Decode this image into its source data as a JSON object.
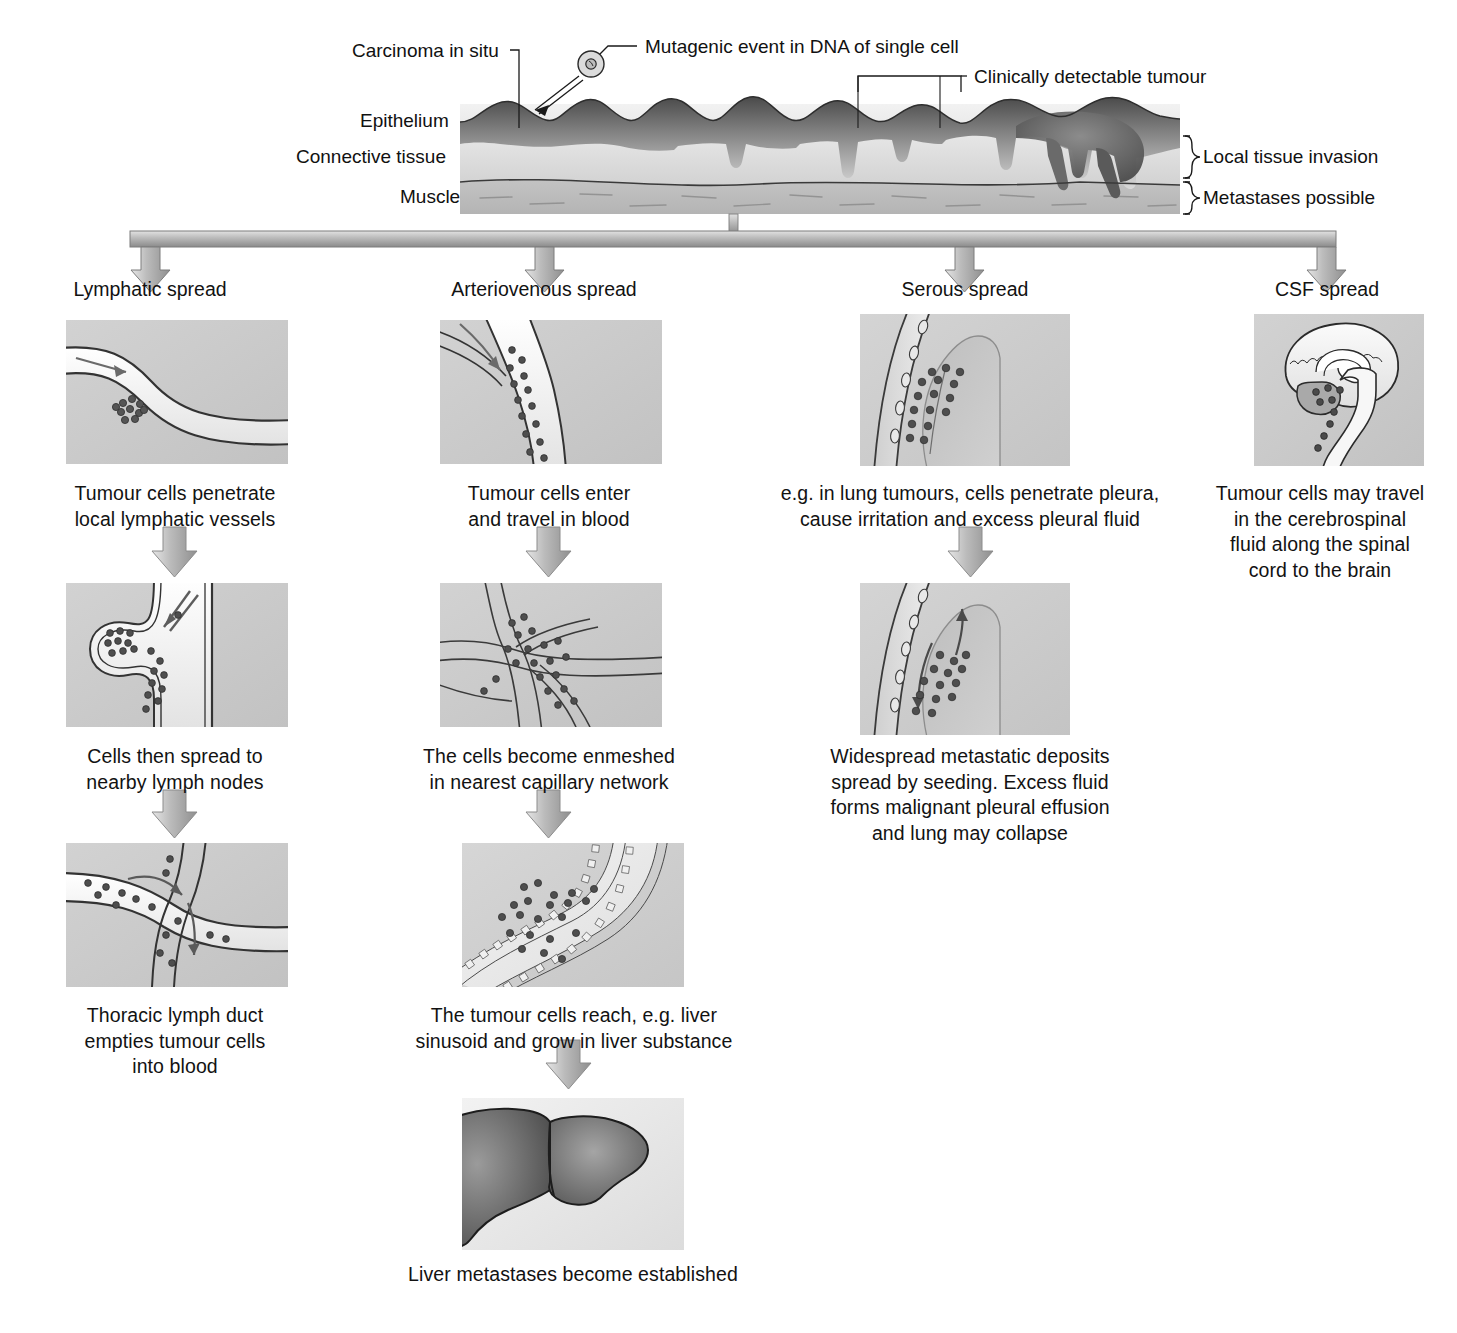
{
  "figure": {
    "type": "flow-diagram"
  },
  "top_panel": {
    "labels": {
      "carcinoma_in_situ": "Carcinoma in situ",
      "mutagenic_event": "Mutagenic event in DNA of single cell",
      "clinically_detectable": "Clinically detectable tumour",
      "epithelium": "Epithelium",
      "connective_tissue": "Connective tissue",
      "muscle": "Muscle",
      "local_tissue_invasion": "Local tissue invasion",
      "metastases_possible": "Metastases possible"
    }
  },
  "columns": [
    {
      "id": "lymphatic",
      "header": "Lymphatic spread",
      "steps": [
        {
          "image": "lymphatic-vessel-penetration-panel",
          "caption": "Tumour cells penetrate\nlocal lymphatic vessels"
        },
        {
          "image": "lymph-node-panel",
          "caption": "Cells then spread to\nnearby lymph nodes"
        },
        {
          "image": "thoracic-duct-panel",
          "caption": "Thoracic lymph duct\nempties tumour cells\ninto blood"
        }
      ]
    },
    {
      "id": "arteriovenous",
      "header": "Arteriovenous spread",
      "steps": [
        {
          "image": "blood-vessel-entry-panel",
          "caption": "Tumour cells enter\nand travel in blood"
        },
        {
          "image": "capillary-network-panel",
          "caption": "The cells become enmeshed\nin nearest capillary network"
        },
        {
          "image": "liver-sinusoid-panel",
          "caption": "The tumour cells reach, e.g. liver\nsinusoid and grow in liver substance"
        },
        {
          "image": "liver-metastases-panel",
          "caption": "Liver metastases become established"
        }
      ]
    },
    {
      "id": "serous",
      "header": "Serous spread",
      "steps": [
        {
          "image": "pleura-penetration-panel",
          "caption": "e.g. in lung tumours, cells penetrate pleura,\ncause irritation and excess pleural fluid"
        },
        {
          "image": "pleural-seeding-panel",
          "caption": "Widespread metastatic deposits\nspread by seeding. Excess fluid\nforms malignant pleural effusion\nand lung may collapse"
        }
      ]
    },
    {
      "id": "csf",
      "header": "CSF spread",
      "steps": [
        {
          "image": "brain-spinal-cord-panel",
          "caption": "Tumour cells may travel\nin the cerebrospinal\nfluid along the spinal\ncord to the brain"
        }
      ]
    }
  ],
  "colors": {
    "panel_background": "#c9c9c9",
    "tumour_cell": "#58585a",
    "arrow_fill": "#b3b3b3",
    "arrow_stroke": "#6e6e6e",
    "text": "#121212",
    "tissue_dark": "#7a7a7a",
    "tissue_light": "#e2e2e2"
  }
}
